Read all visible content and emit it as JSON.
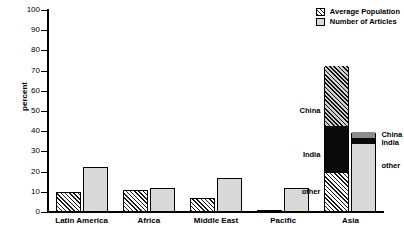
{
  "chart_data": {
    "type": "bar",
    "title": "",
    "xlabel": "",
    "ylabel": "percent",
    "ylim": [
      0,
      100
    ],
    "yticks": [
      0,
      10,
      20,
      30,
      40,
      50,
      60,
      70,
      80,
      90,
      100
    ],
    "grid": false,
    "legend_position": "top-right",
    "categories": [
      "Latin America",
      "Africa",
      "Middle East",
      "Pacific",
      "Asia"
    ],
    "series": [
      {
        "name": "Average Population",
        "fill": "hatched",
        "values": [
          10,
          11,
          7,
          0.7,
          72
        ]
      },
      {
        "name": "Number of Articles",
        "fill": "light-gray",
        "values": [
          22.5,
          12,
          17,
          12,
          39
        ]
      }
    ],
    "stacked_category": "Asia",
    "asia_breakdown": {
      "Average Population": [
        {
          "label": "other",
          "value": 19
        },
        {
          "label": "India",
          "value": 23
        },
        {
          "label": "China",
          "value": 30
        }
      ],
      "Number of Articles": [
        {
          "label": "other",
          "value": 33
        },
        {
          "label": "India",
          "value": 3
        },
        {
          "label": "China",
          "value": 3
        }
      ]
    },
    "annotations": [
      {
        "text": "China",
        "side": "left",
        "value": 50
      },
      {
        "text": "India",
        "side": "left",
        "value": 28
      },
      {
        "text": "other",
        "side": "left",
        "value": 10
      },
      {
        "text": "China",
        "side": "right",
        "value": 38
      },
      {
        "text": "India",
        "side": "right",
        "value": 34
      },
      {
        "text": "other",
        "side": "right",
        "value": 23
      }
    ]
  },
  "legend": {
    "items": [
      {
        "label": "Average Population",
        "swatch": "hatched"
      },
      {
        "label": "Number of Articles",
        "swatch": "light-gray"
      }
    ]
  },
  "axis": {
    "y_title": "percent",
    "y_ticks": [
      "0",
      "10",
      "20",
      "30",
      "40",
      "50",
      "60",
      "70",
      "80",
      "90",
      "100"
    ]
  }
}
